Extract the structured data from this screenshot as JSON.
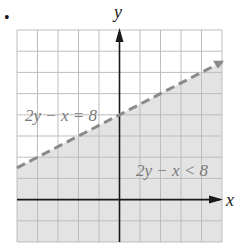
{
  "chart_data": {
    "type": "line",
    "title": "",
    "xlabel": "x",
    "ylabel": "y",
    "xlim": [
      -5,
      5
    ],
    "ylim": [
      -2,
      8
    ],
    "grid": true,
    "grid_step": 1,
    "series": [
      {
        "name": "2y − x = 8",
        "style": "dashed",
        "equation": "y = x/2 + 4",
        "x": [
          -5,
          5
        ],
        "y": [
          1.5,
          6.5
        ]
      }
    ],
    "shaded_region": {
      "label": "2y − x < 8",
      "side": "below boundary line",
      "color": "#e3e3e3"
    },
    "annotations": [
      {
        "text": "2y − x = 8",
        "x": -3,
        "y": 4.5
      },
      {
        "text": "2y − x < 8",
        "x": 3,
        "y": 1.7
      }
    ]
  },
  "labels": {
    "bullet": "•",
    "x_axis": "x",
    "y_axis": "y",
    "boundary": "2y − x = 8",
    "region": "2y − x < 8"
  },
  "colors": {
    "grid": "#bdbdbd",
    "axis": "#1a1a1a",
    "boundary": "#8a8a8a",
    "shade": "#e3e3e3",
    "label": "#7a7a7a"
  }
}
